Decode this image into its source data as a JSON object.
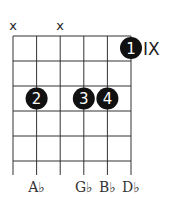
{
  "diagram": {
    "type": "guitar-chord-diagram",
    "num_strings": 6,
    "num_frets_shown": 5,
    "fret_position_label": "IX",
    "muted_strings": [
      {
        "string": 1,
        "symbol": "x"
      },
      {
        "string": 3,
        "symbol": "x"
      }
    ],
    "fingers": [
      {
        "finger": "1",
        "string": 6,
        "fret": 1
      },
      {
        "finger": "2",
        "string": 2,
        "fret": 3
      },
      {
        "finger": "3",
        "string": 4,
        "fret": 3
      },
      {
        "finger": "4",
        "string": 5,
        "fret": 3
      }
    ],
    "note_names": [
      {
        "string": 2,
        "label": "A♭"
      },
      {
        "string": 4,
        "label": "G♭"
      },
      {
        "string": 5,
        "label": "B♭"
      },
      {
        "string": 6,
        "label": "D♭"
      }
    ],
    "colors": {
      "dot": "#111111",
      "dot_text": "#ffffff",
      "grid": "#333333"
    }
  }
}
